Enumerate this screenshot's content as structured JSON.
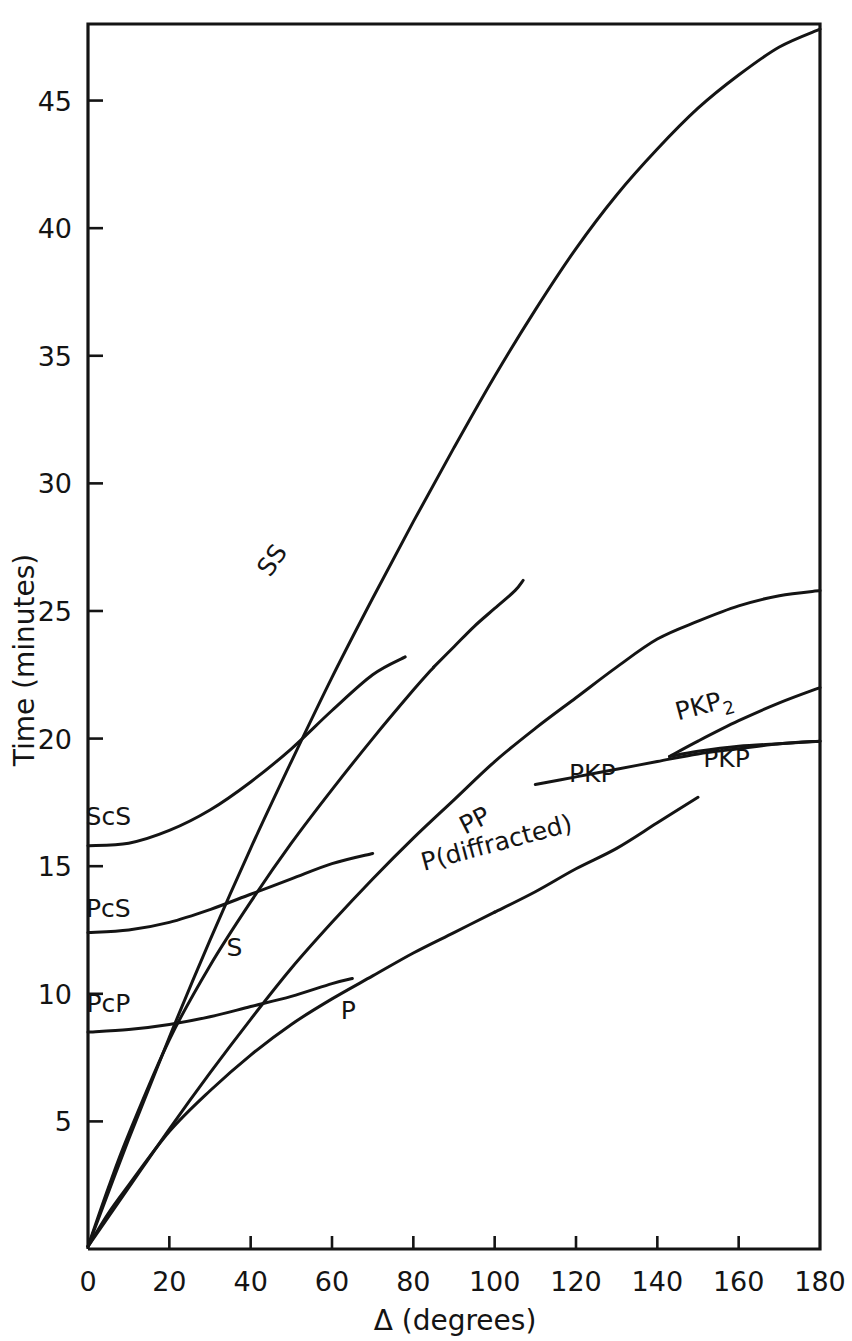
{
  "chart_data": {
    "type": "line",
    "title": "",
    "xlabel": "Δ (degrees)",
    "ylabel": "Time (minutes)",
    "xlim": [
      0,
      180
    ],
    "ylim": [
      0,
      48
    ],
    "grid": false,
    "legend_position": "inline-curve-labels",
    "xticks": [
      "0",
      "20",
      "40",
      "60",
      "80",
      "100",
      "120",
      "140",
      "160",
      "180"
    ],
    "xtick_values": [
      0,
      20,
      40,
      60,
      80,
      100,
      120,
      140,
      160,
      180
    ],
    "yticks": [
      "5",
      "10",
      "15",
      "20",
      "25",
      "30",
      "35",
      "40",
      "45"
    ],
    "ytick_values": [
      5,
      10,
      15,
      20,
      25,
      30,
      35,
      40,
      45
    ],
    "series": [
      {
        "name": "P",
        "label": "P",
        "label_x": 64,
        "label_y": 9.0,
        "label_rotation": 0,
        "points": [
          [
            0,
            0.1
          ],
          [
            5,
            1.4
          ],
          [
            10,
            2.5
          ],
          [
            20,
            4.6
          ],
          [
            30,
            6.2
          ],
          [
            40,
            7.6
          ],
          [
            50,
            8.8
          ],
          [
            60,
            9.8
          ],
          [
            70,
            10.7
          ],
          [
            80,
            11.6
          ],
          [
            90,
            12.4
          ],
          [
            100,
            13.2
          ]
        ]
      },
      {
        "name": "P(diffracted)",
        "label": "P(diffracted)",
        "label_x": 101,
        "label_y": 15.6,
        "label_rotation": -15,
        "points": [
          [
            100,
            13.2
          ],
          [
            110,
            14.0
          ],
          [
            120,
            14.9
          ],
          [
            130,
            15.7
          ],
          [
            140,
            16.7
          ],
          [
            150,
            17.7
          ]
        ]
      },
      {
        "name": "PP",
        "label": "PP",
        "label_x": 96,
        "label_y": 16.5,
        "label_rotation": -27,
        "points": [
          [
            0,
            0.1
          ],
          [
            10,
            2.4
          ],
          [
            20,
            4.7
          ],
          [
            30,
            6.9
          ],
          [
            40,
            9.0
          ],
          [
            50,
            11.0
          ],
          [
            60,
            12.8
          ],
          [
            70,
            14.5
          ],
          [
            80,
            16.1
          ],
          [
            90,
            17.6
          ],
          [
            100,
            19.1
          ],
          [
            110,
            20.4
          ],
          [
            120,
            21.6
          ],
          [
            130,
            22.8
          ],
          [
            140,
            23.9
          ],
          [
            150,
            24.6
          ],
          [
            160,
            25.2
          ],
          [
            170,
            25.6
          ],
          [
            180,
            25.8
          ]
        ]
      },
      {
        "name": "S",
        "label": "S",
        "label_x": 36,
        "label_y": 11.5,
        "label_rotation": 0,
        "points": [
          [
            0,
            0.1
          ],
          [
            5,
            2.4
          ],
          [
            10,
            4.5
          ],
          [
            20,
            8.2
          ],
          [
            30,
            11.1
          ],
          [
            40,
            13.6
          ],
          [
            50,
            15.9
          ],
          [
            60,
            18.0
          ],
          [
            70,
            20.0
          ],
          [
            80,
            21.9
          ],
          [
            85,
            22.8
          ]
        ]
      },
      {
        "name": "SS",
        "label": "SS",
        "label_x": 47,
        "label_y": 26.8,
        "label_rotation": -55,
        "points": [
          [
            0,
            0.1
          ],
          [
            10,
            4.3
          ],
          [
            20,
            8.3
          ],
          [
            30,
            12.1
          ],
          [
            40,
            15.7
          ],
          [
            50,
            19.1
          ],
          [
            60,
            22.4
          ],
          [
            70,
            25.5
          ],
          [
            80,
            28.5
          ],
          [
            90,
            31.4
          ],
          [
            100,
            34.2
          ],
          [
            110,
            36.8
          ],
          [
            120,
            39.2
          ],
          [
            130,
            41.3
          ],
          [
            140,
            43.1
          ],
          [
            150,
            44.7
          ],
          [
            160,
            46.0
          ],
          [
            170,
            47.1
          ],
          [
            180,
            47.8
          ]
        ]
      },
      {
        "name": "SS-branch",
        "label": "",
        "label_x": 0,
        "label_y": 0,
        "label_rotation": 0,
        "points": [
          [
            85,
            22.8
          ],
          [
            90,
            23.6
          ],
          [
            95,
            24.4
          ],
          [
            100,
            25.1
          ],
          [
            105,
            25.8
          ],
          [
            107,
            26.2
          ]
        ]
      },
      {
        "name": "ScS",
        "label": "ScS",
        "label_x": 5,
        "label_y": 16.6,
        "label_rotation": 0,
        "points": [
          [
            0,
            15.8
          ],
          [
            10,
            15.9
          ],
          [
            20,
            16.4
          ],
          [
            30,
            17.2
          ],
          [
            40,
            18.3
          ],
          [
            50,
            19.6
          ],
          [
            60,
            21.1
          ],
          [
            70,
            22.5
          ],
          [
            78,
            23.2
          ]
        ]
      },
      {
        "name": "PcS",
        "label": "PcS",
        "label_x": 5,
        "label_y": 13.0,
        "label_rotation": 0,
        "points": [
          [
            0,
            12.4
          ],
          [
            10,
            12.5
          ],
          [
            20,
            12.8
          ],
          [
            30,
            13.3
          ],
          [
            40,
            13.9
          ],
          [
            50,
            14.5
          ],
          [
            60,
            15.1
          ],
          [
            70,
            15.5
          ]
        ]
      },
      {
        "name": "PcP",
        "label": "PcP",
        "label_x": 5,
        "label_y": 9.3,
        "label_rotation": 0,
        "points": [
          [
            0,
            8.5
          ],
          [
            10,
            8.6
          ],
          [
            20,
            8.8
          ],
          [
            30,
            9.1
          ],
          [
            40,
            9.5
          ],
          [
            50,
            9.9
          ],
          [
            60,
            10.4
          ],
          [
            65,
            10.6
          ]
        ]
      },
      {
        "name": "PKP",
        "label": "PKP",
        "label_x": 124,
        "label_y": 18.3,
        "label_rotation": 0,
        "points": [
          [
            110,
            18.2
          ],
          [
            120,
            18.5
          ],
          [
            130,
            18.8
          ],
          [
            140,
            19.1
          ],
          [
            150,
            19.4
          ],
          [
            160,
            19.6
          ],
          [
            170,
            19.8
          ],
          [
            180,
            19.9
          ]
        ]
      },
      {
        "name": "PKP2",
        "label": "PKP₂",
        "label_x": 152,
        "label_y": 21.0,
        "label_rotation": -15,
        "points": [
          [
            143,
            19.3
          ],
          [
            150,
            19.9
          ],
          [
            160,
            20.7
          ],
          [
            170,
            21.4
          ],
          [
            180,
            22.0
          ]
        ]
      },
      {
        "name": "PKP-right",
        "label": "PKP",
        "label_x": 157,
        "label_y": 18.9,
        "label_rotation": 0,
        "points": [
          [
            143,
            19.3
          ],
          [
            150,
            19.5
          ],
          [
            160,
            19.7
          ],
          [
            170,
            19.8
          ],
          [
            180,
            19.9
          ]
        ]
      }
    ],
    "colors": {
      "ink": "#141414",
      "background": "#ffffff"
    }
  }
}
